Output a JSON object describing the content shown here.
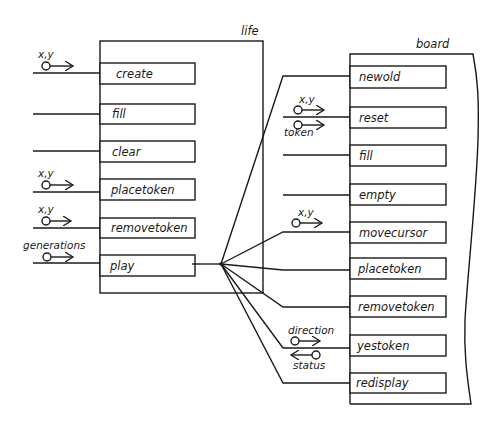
{
  "modules": {
    "life": {
      "title": "life",
      "operations": [
        {
          "label": "create",
          "input": "x,y"
        },
        {
          "label": "fill",
          "input": ""
        },
        {
          "label": "clear",
          "input": ""
        },
        {
          "label": "placetoken",
          "input": "x,y"
        },
        {
          "label": "removetoken",
          "input": "x,y"
        },
        {
          "label": "play",
          "input": "generations"
        }
      ]
    },
    "board": {
      "title": "board",
      "operations": [
        {
          "label": "newold",
          "inputs": []
        },
        {
          "label": "reset",
          "inputs": [
            "x,y",
            "token"
          ]
        },
        {
          "label": "fill",
          "inputs": []
        },
        {
          "label": "empty",
          "inputs": []
        },
        {
          "label": "movecursor",
          "inputs": [
            "x,y"
          ]
        },
        {
          "label": "placetoken",
          "inputs": []
        },
        {
          "label": "removetoken",
          "inputs": []
        },
        {
          "label": "yestoken",
          "inputs": [
            "direction"
          ],
          "outputs": [
            "status"
          ]
        },
        {
          "label": "redisplay",
          "inputs": []
        }
      ]
    }
  },
  "calls": {
    "from": "play",
    "to": [
      "newold",
      "movecursor",
      "placetoken",
      "removetoken",
      "yestoken",
      "redisplay"
    ]
  },
  "colors": {
    "line": "#1a1a1a",
    "background": "#ffffff"
  }
}
